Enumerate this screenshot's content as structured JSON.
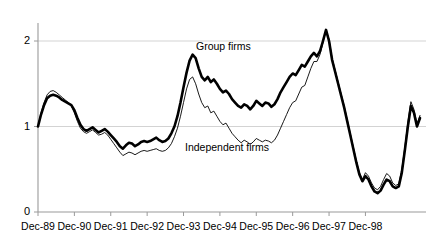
{
  "chart_data": {
    "type": "line",
    "title": "",
    "xlabel": "",
    "ylabel": "",
    "ylim": [
      0,
      2.3
    ],
    "yticks": [
      0,
      1,
      2
    ],
    "ytick_labels": [
      "0",
      "1",
      "2"
    ],
    "grid": true,
    "gridlines_at": [
      1,
      2
    ],
    "legend_position": "inline-annotation",
    "xtick_labels": [
      "Dec-89",
      "Dec-90",
      "Dec-91",
      "Dec-92",
      "Dec-93",
      "Dec-94",
      "Dec-95",
      "Dec-96",
      "Dec-97",
      "Dec-98"
    ],
    "x_start": "Dec-89",
    "x_end": "Dec-99",
    "x_frequency": "monthly",
    "annotations": [
      {
        "text": "Group firms",
        "series": "Group firms",
        "x_approx": "Dec-93"
      },
      {
        "text": "Independent firms",
        "series": "Independent firms",
        "x_approx": "Dec-94"
      }
    ],
    "series": [
      {
        "name": "Group firms",
        "style": "thick-solid",
        "color": "#000000",
        "linewidth": 2.6,
        "values": [
          1.0,
          1.14,
          1.25,
          1.33,
          1.36,
          1.37,
          1.36,
          1.34,
          1.31,
          1.29,
          1.27,
          1.25,
          1.19,
          1.1,
          1.02,
          0.97,
          0.95,
          0.97,
          0.99,
          0.96,
          0.93,
          0.95,
          0.97,
          0.94,
          0.9,
          0.86,
          0.82,
          0.77,
          0.74,
          0.78,
          0.81,
          0.8,
          0.77,
          0.79,
          0.82,
          0.83,
          0.82,
          0.83,
          0.85,
          0.87,
          0.84,
          0.82,
          0.83,
          0.86,
          0.92,
          1.0,
          1.12,
          1.28,
          1.46,
          1.63,
          1.77,
          1.84,
          1.8,
          1.68,
          1.58,
          1.54,
          1.58,
          1.52,
          1.55,
          1.5,
          1.44,
          1.4,
          1.42,
          1.38,
          1.32,
          1.28,
          1.24,
          1.22,
          1.26,
          1.24,
          1.2,
          1.24,
          1.3,
          1.27,
          1.24,
          1.28,
          1.27,
          1.23,
          1.26,
          1.32,
          1.4,
          1.46,
          1.52,
          1.58,
          1.62,
          1.6,
          1.66,
          1.72,
          1.7,
          1.76,
          1.82,
          1.86,
          1.82,
          1.88,
          2.0,
          2.13,
          2.0,
          1.78,
          1.64,
          1.5,
          1.36,
          1.22,
          1.06,
          0.9,
          0.74,
          0.58,
          0.44,
          0.36,
          0.42,
          0.38,
          0.3,
          0.24,
          0.22,
          0.25,
          0.32,
          0.38,
          0.36,
          0.3,
          0.28,
          0.3,
          0.46,
          0.72,
          1.0,
          1.24,
          1.16,
          1.0,
          1.1
        ]
      },
      {
        "name": "Independent firms",
        "style": "thin-solid",
        "color": "#000000",
        "linewidth": 0.9,
        "values": [
          1.0,
          1.16,
          1.28,
          1.37,
          1.41,
          1.42,
          1.4,
          1.37,
          1.34,
          1.31,
          1.28,
          1.24,
          1.16,
          1.06,
          0.98,
          0.94,
          0.92,
          0.94,
          0.96,
          0.93,
          0.9,
          0.91,
          0.93,
          0.9,
          0.85,
          0.8,
          0.75,
          0.7,
          0.66,
          0.68,
          0.7,
          0.69,
          0.67,
          0.69,
          0.71,
          0.72,
          0.71,
          0.72,
          0.73,
          0.74,
          0.72,
          0.71,
          0.72,
          0.75,
          0.8,
          0.88,
          0.98,
          1.12,
          1.28,
          1.44,
          1.55,
          1.58,
          1.5,
          1.38,
          1.28,
          1.22,
          1.24,
          1.16,
          1.18,
          1.12,
          1.06,
          1.02,
          1.04,
          0.98,
          0.92,
          0.88,
          0.84,
          0.81,
          0.84,
          0.82,
          0.79,
          0.82,
          0.86,
          0.84,
          0.82,
          0.84,
          0.83,
          0.81,
          0.84,
          0.9,
          0.98,
          1.06,
          1.14,
          1.22,
          1.28,
          1.3,
          1.38,
          1.46,
          1.48,
          1.58,
          1.68,
          1.76,
          1.76,
          1.84,
          1.98,
          2.13,
          2.02,
          1.8,
          1.66,
          1.52,
          1.38,
          1.24,
          1.08,
          0.92,
          0.76,
          0.6,
          0.46,
          0.38,
          0.46,
          0.42,
          0.34,
          0.28,
          0.26,
          0.3,
          0.38,
          0.45,
          0.42,
          0.34,
          0.31,
          0.33,
          0.5,
          0.76,
          1.05,
          1.29,
          1.2,
          1.03,
          1.13
        ]
      }
    ]
  }
}
